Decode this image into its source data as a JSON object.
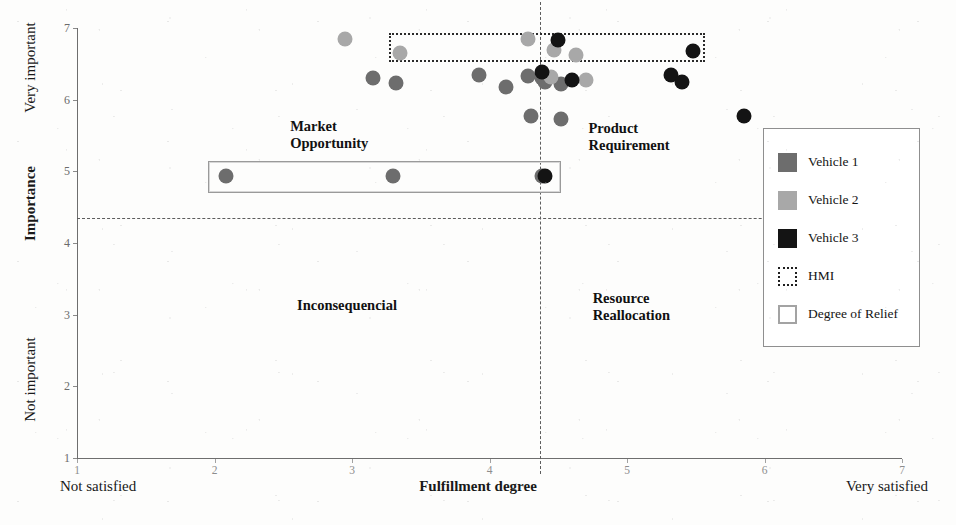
{
  "chart_data": {
    "type": "scatter",
    "title": "",
    "xlabel": "Fulfillment degree",
    "ylabel": "Importance",
    "xlim": [
      1,
      7
    ],
    "ylim": [
      1,
      7
    ],
    "grid": false,
    "x_ticks": [
      1,
      2,
      3,
      4,
      5,
      6,
      7
    ],
    "y_ticks": [
      1,
      2,
      3,
      4,
      5,
      6,
      7
    ],
    "x_axis_left_caption": "Not satisfied",
    "x_axis_right_caption": "Very satisfied",
    "y_axis_top_caption": "Very important",
    "y_axis_bottom_caption": "Not important",
    "quadrant_divider_x": 4.37,
    "quadrant_divider_y": 4.35,
    "legend_position": "right",
    "quadrants": [
      {
        "name": "market-opportunity",
        "label": "Market\nOpportunity",
        "x": 2.55,
        "y": 5.75
      },
      {
        "name": "product-requirement",
        "label": "Product\nRequirement",
        "x": 4.72,
        "y": 5.72
      },
      {
        "name": "inconsequential",
        "label": "Inconsequencial",
        "x": 2.6,
        "y": 3.25
      },
      {
        "name": "resource-reallocation",
        "label": "Resource\nReallocation",
        "x": 4.75,
        "y": 3.35
      }
    ],
    "series": [
      {
        "name": "Vehicle 1",
        "color": "#6d6d6d",
        "points": [
          {
            "x": 3.15,
            "y": 6.3
          },
          {
            "x": 3.32,
            "y": 6.23
          },
          {
            "x": 3.92,
            "y": 6.35
          },
          {
            "x": 4.12,
            "y": 6.18
          },
          {
            "x": 4.28,
            "y": 6.33
          },
          {
            "x": 4.38,
            "y": 6.3
          },
          {
            "x": 4.4,
            "y": 6.24
          },
          {
            "x": 4.52,
            "y": 6.22
          },
          {
            "x": 4.3,
            "y": 5.77
          },
          {
            "x": 4.52,
            "y": 5.73
          },
          {
            "x": 4.38,
            "y": 4.93
          },
          {
            "x": 2.08,
            "y": 4.93
          },
          {
            "x": 3.3,
            "y": 4.93
          }
        ]
      },
      {
        "name": "Vehicle 2",
        "color": "#a8a8a8",
        "points": [
          {
            "x": 2.95,
            "y": 6.85
          },
          {
            "x": 3.35,
            "y": 6.65
          },
          {
            "x": 4.28,
            "y": 6.85
          },
          {
            "x": 4.47,
            "y": 6.7
          },
          {
            "x": 4.63,
            "y": 6.63
          },
          {
            "x": 4.45,
            "y": 6.32
          },
          {
            "x": 4.7,
            "y": 6.28
          }
        ]
      },
      {
        "name": "Vehicle 3",
        "color": "#141414",
        "points": [
          {
            "x": 4.5,
            "y": 6.83
          },
          {
            "x": 5.48,
            "y": 6.68
          },
          {
            "x": 4.38,
            "y": 6.38
          },
          {
            "x": 4.6,
            "y": 6.28
          },
          {
            "x": 5.32,
            "y": 6.34
          },
          {
            "x": 5.4,
            "y": 6.25
          },
          {
            "x": 5.85,
            "y": 5.77
          },
          {
            "x": 4.4,
            "y": 4.93
          }
        ]
      }
    ],
    "annotations": [
      {
        "name": "HMI",
        "style": "dotted-box",
        "x0": 3.27,
        "x1": 5.57,
        "y0": 6.52,
        "y1": 6.93
      },
      {
        "name": "Degree of Relief",
        "style": "solid-box",
        "x0": 1.95,
        "x1": 4.52,
        "y0": 4.7,
        "y1": 5.15
      }
    ]
  },
  "legend": {
    "items": [
      {
        "label": "Vehicle 1",
        "swatch": "fill",
        "color": "#6d6d6d"
      },
      {
        "label": "Vehicle 2",
        "swatch": "fill",
        "color": "#a8a8a8"
      },
      {
        "label": "Vehicle 3",
        "swatch": "fill",
        "color": "#141414"
      },
      {
        "label": "HMI",
        "swatch": "dotted",
        "color": "#1f1f1f"
      },
      {
        "label": "Degree of Relief",
        "swatch": "outline",
        "color": "#a3a3a3"
      }
    ]
  }
}
